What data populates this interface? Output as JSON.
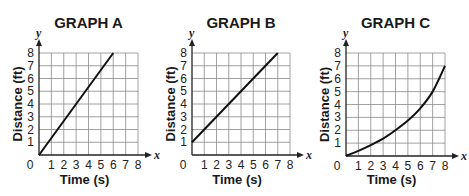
{
  "chart_data": [
    {
      "type": "line",
      "title": "GRAPH A",
      "xlabel": "Time (s)",
      "ylabel": "Distance (ft)",
      "x_var": "x",
      "y_var": "y",
      "xlim": [
        0,
        8
      ],
      "ylim": [
        0,
        8
      ],
      "xticks": [
        "0",
        "1",
        "2",
        "3",
        "4",
        "5",
        "6",
        "7",
        "8"
      ],
      "yticks": [
        "1",
        "2",
        "3",
        "4",
        "5",
        "6",
        "7",
        "8"
      ],
      "grid": true,
      "series": [
        {
          "name": "Graph A",
          "x": [
            0,
            6
          ],
          "y": [
            0,
            8
          ]
        }
      ]
    },
    {
      "type": "line",
      "title": "GRAPH B",
      "xlabel": "Time (s)",
      "ylabel": "Distance (ft)",
      "x_var": "x",
      "y_var": "y",
      "xlim": [
        0,
        8
      ],
      "ylim": [
        0,
        8
      ],
      "xticks": [
        "0",
        "1",
        "2",
        "3",
        "4",
        "5",
        "6",
        "7",
        "8"
      ],
      "yticks": [
        "1",
        "2",
        "3",
        "4",
        "5",
        "6",
        "7",
        "8"
      ],
      "grid": true,
      "series": [
        {
          "name": "Graph B",
          "x": [
            0,
            7
          ],
          "y": [
            1,
            8
          ]
        }
      ]
    },
    {
      "type": "line",
      "title": "GRAPH C",
      "xlabel": "Time (s)",
      "ylabel": "Distance (ft)",
      "x_var": "x",
      "y_var": "y",
      "xlim": [
        0,
        8
      ],
      "ylim": [
        0,
        8
      ],
      "xticks": [
        "0",
        "1",
        "2",
        "3",
        "4",
        "5",
        "6",
        "7",
        "8"
      ],
      "yticks": [
        "1",
        "2",
        "3",
        "4",
        "5",
        "6",
        "7",
        "8"
      ],
      "grid": true,
      "series": [
        {
          "name": "Graph C",
          "x": [
            0,
            1,
            2,
            3,
            4,
            5,
            6,
            7,
            8
          ],
          "y": [
            0,
            0.4,
            0.85,
            1.35,
            2,
            2.75,
            3.7,
            5,
            7
          ]
        }
      ]
    }
  ]
}
